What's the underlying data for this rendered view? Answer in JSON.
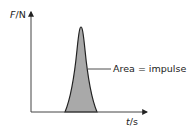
{
  "diagram": {
    "y_axis": {
      "var": "F",
      "unit": "/N"
    },
    "x_axis": {
      "var": "t",
      "unit": "/s"
    },
    "annotation": "Area = impulse",
    "shape": "force-time pulse (bell curve)",
    "fill_color": "#a9a9a9",
    "line_color": "#222222"
  }
}
